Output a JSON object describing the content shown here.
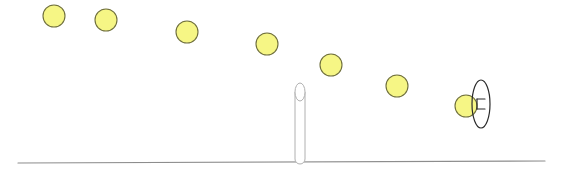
{
  "canvas": {
    "width": 561,
    "height": 179,
    "background": "#ffffff"
  },
  "colors": {
    "ball_fill": "#f6f685",
    "ball_stroke": "#6f6f3c",
    "ground_stroke": "#8d8d8d",
    "post_stroke": "#b0b0b0",
    "hoop_stroke": "#2b2b2b",
    "marker_stroke": "#2b2b2b"
  },
  "chart_data": {
    "type": "scatter",
    "title": "",
    "subtitle": "",
    "xlabel": "",
    "ylabel": "",
    "xlim": [
      0,
      561
    ],
    "ylim": [
      179,
      0
    ],
    "grid": false,
    "legend": "none",
    "annotations": [],
    "series": [
      {
        "name": "ball-trajectory",
        "marker": "circle",
        "marker_radius": 11,
        "fill": "#f6f685",
        "stroke": "#6f6f3c",
        "x": [
          54,
          106,
          187,
          267,
          331,
          397,
          466
        ],
        "y": [
          16,
          20,
          32,
          44,
          65,
          86,
          106
        ]
      }
    ]
  },
  "scene": {
    "ground": {
      "label": "ground-line",
      "x1": 18,
      "y1": 163,
      "x2": 545,
      "y2": 161,
      "stroke_width": 1.2
    },
    "post": {
      "label": "vertical-post",
      "cx": 300,
      "top_y": 92,
      "bottom_y": 163,
      "half_width": 5,
      "cap_ry": 9,
      "stroke_width": 1
    },
    "hoop": {
      "label": "hoop-ring-edge-on",
      "cx": 481,
      "cy": 104,
      "rx": 9,
      "ry": 24,
      "stroke_width": 1.2
    },
    "hoop_marker": {
      "label": "hoop-center-marker",
      "cx": 481,
      "cy": 104,
      "tick_half_width": 4,
      "gap": 5,
      "stroke_width": 1.2
    }
  },
  "balls": [
    {
      "id": "ball-1",
      "cx": 54,
      "cy": 16,
      "r": 11
    },
    {
      "id": "ball-2",
      "cx": 106,
      "cy": 20,
      "r": 11
    },
    {
      "id": "ball-3",
      "cx": 187,
      "cy": 32,
      "r": 11
    },
    {
      "id": "ball-4",
      "cx": 267,
      "cy": 44,
      "r": 11
    },
    {
      "id": "ball-5",
      "cx": 331,
      "cy": 65,
      "r": 11
    },
    {
      "id": "ball-6",
      "cx": 397,
      "cy": 86,
      "r": 11
    },
    {
      "id": "ball-7",
      "cx": 466,
      "cy": 106,
      "r": 11
    }
  ]
}
